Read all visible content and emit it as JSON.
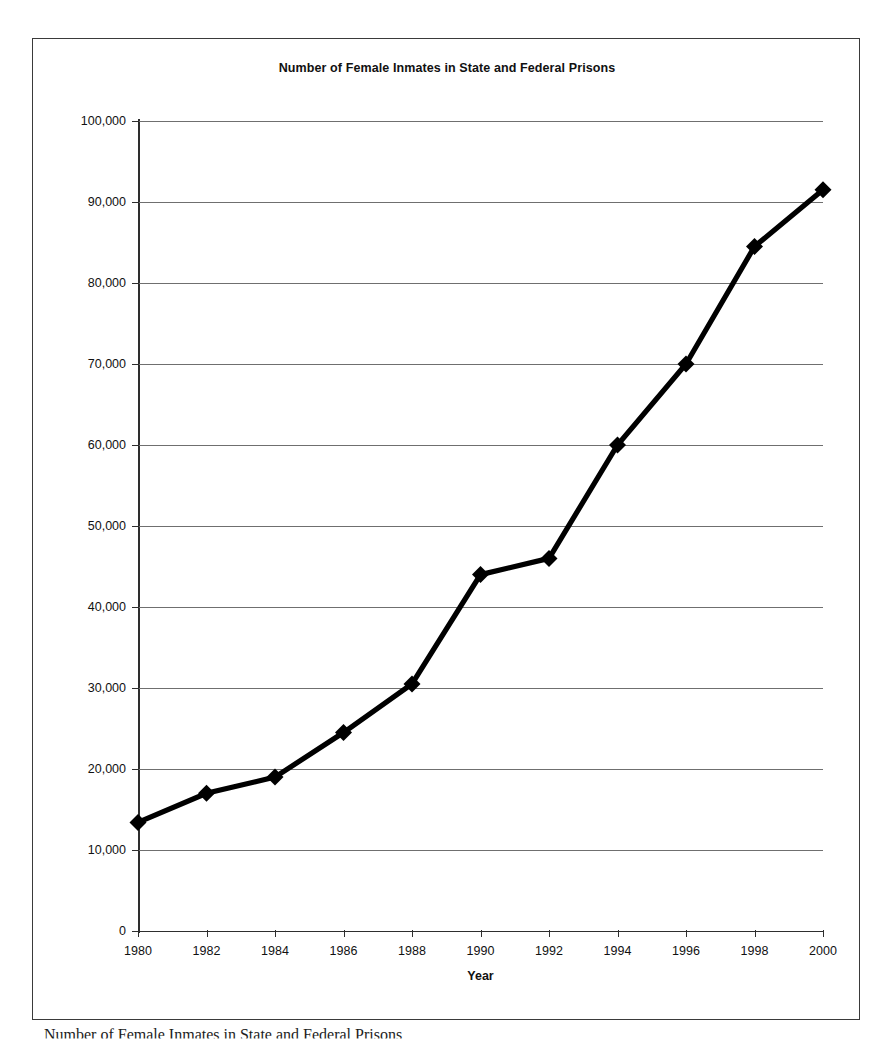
{
  "chart_data": {
    "type": "line",
    "title": "Number of Female Inmates in State and Federal Prisons",
    "xlabel": "Year",
    "ylabel": "# of Inmates",
    "x": [
      1980,
      1982,
      1984,
      1986,
      1988,
      1990,
      1992,
      1994,
      1996,
      1998,
      2000
    ],
    "categories": [
      "1980",
      "1982",
      "1984",
      "1986",
      "1988",
      "1990",
      "1992",
      "1994",
      "1996",
      "1998",
      "2000"
    ],
    "values": [
      13400,
      17000,
      19000,
      24500,
      30500,
      44000,
      46000,
      60000,
      70000,
      84500,
      91500
    ],
    "series": [
      {
        "name": "# of Inmates",
        "values": [
          13400,
          17000,
          19000,
          24500,
          30500,
          44000,
          46000,
          60000,
          70000,
          84500,
          91500
        ]
      }
    ],
    "ylim": [
      0,
      100000
    ],
    "xlim": [
      1980,
      2000
    ],
    "y_ticks": [
      0,
      10000,
      20000,
      30000,
      40000,
      50000,
      60000,
      70000,
      80000,
      90000,
      100000
    ],
    "y_tick_labels": [
      "0",
      "10,000",
      "20,000",
      "30,000",
      "40,000",
      "50,000",
      "60,000",
      "70,000",
      "80,000",
      "90,000",
      "100,000"
    ],
    "x_ticks": [
      1980,
      1982,
      1984,
      1986,
      1988,
      1990,
      1992,
      1994,
      1996,
      1998,
      2000
    ],
    "grid": "horizontal",
    "legend": "none",
    "line_color": "#000000",
    "marker": "diamond",
    "marker_color": "#000000",
    "gridline_color": "#6f6f6f",
    "axis_color": "#2e2e2e",
    "background": "#ffffff"
  },
  "figure": {
    "border_color": "#3a3a3a",
    "caption": "Number of Female Inmates in State and Federal Prisons"
  }
}
